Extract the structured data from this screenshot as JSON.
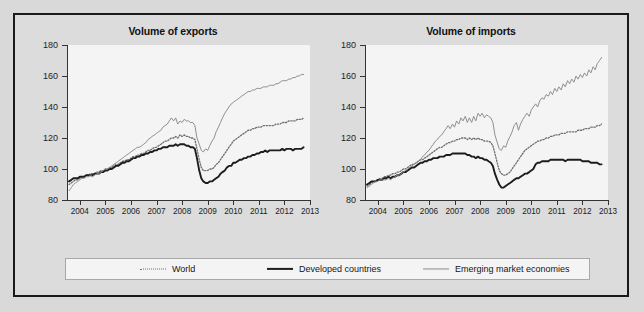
{
  "figure": {
    "background_color": "#dcdcdc",
    "border_color": "#1a1a1a",
    "plot_background_color": "#f4f4f4"
  },
  "legend": {
    "position": "bottom-center",
    "items": [
      {
        "label": "World",
        "style": "dotted",
        "color": "#6e6e6e"
      },
      {
        "label": "Developed countries",
        "style": "solid-thick",
        "color": "#1d1d1d"
      },
      {
        "label": "Emerging market economies",
        "style": "solid-thin",
        "color": "#8a8a8a"
      }
    ]
  },
  "chart_data": [
    {
      "type": "line",
      "title": "Volume of exports",
      "xlabel": "",
      "ylabel": "",
      "ylim": [
        80,
        180
      ],
      "yticks": [
        80,
        100,
        120,
        140,
        160,
        180
      ],
      "xlim": [
        2003.5,
        2013.0
      ],
      "xticks": [
        2004,
        2005,
        2006,
        2007,
        2008,
        2009,
        2010,
        2011,
        2012,
        2013
      ],
      "xtick_labels": [
        "2004",
        "2005",
        "2006",
        "2007",
        "2008",
        "2009",
        "2010",
        "2011",
        "2012",
        "2013"
      ],
      "grid": false,
      "x": [
        2003.58,
        2003.67,
        2003.75,
        2003.83,
        2003.92,
        2004.0,
        2004.08,
        2004.17,
        2004.25,
        2004.33,
        2004.42,
        2004.5,
        2004.58,
        2004.67,
        2004.75,
        2004.83,
        2004.92,
        2005.0,
        2005.08,
        2005.17,
        2005.25,
        2005.33,
        2005.42,
        2005.5,
        2005.58,
        2005.67,
        2005.75,
        2005.83,
        2005.92,
        2006.0,
        2006.08,
        2006.17,
        2006.25,
        2006.33,
        2006.42,
        2006.5,
        2006.58,
        2006.67,
        2006.75,
        2006.83,
        2006.92,
        2007.0,
        2007.08,
        2007.17,
        2007.25,
        2007.33,
        2007.42,
        2007.5,
        2007.58,
        2007.67,
        2007.75,
        2007.83,
        2007.92,
        2008.0,
        2008.08,
        2008.17,
        2008.25,
        2008.33,
        2008.42,
        2008.5,
        2008.58,
        2008.67,
        2008.75,
        2008.83,
        2008.92,
        2009.0,
        2009.08,
        2009.17,
        2009.25,
        2009.33,
        2009.42,
        2009.5,
        2009.58,
        2009.67,
        2009.75,
        2009.83,
        2009.92,
        2010.0,
        2010.08,
        2010.17,
        2010.25,
        2010.33,
        2010.42,
        2010.5,
        2010.58,
        2010.67,
        2010.75,
        2010.83,
        2010.92,
        2011.0,
        2011.08,
        2011.17,
        2011.25,
        2011.33,
        2011.42,
        2011.5,
        2011.58,
        2011.67,
        2011.75,
        2011.83,
        2011.92,
        2012.0,
        2012.08,
        2012.17,
        2012.25,
        2012.33,
        2012.42,
        2012.5,
        2012.58,
        2012.67,
        2012.75,
        2012.83,
        2012.92
      ],
      "series": [
        {
          "name": "World",
          "style": "dotted",
          "color": "#6e6e6e",
          "values": [
            90,
            91,
            92,
            93,
            93,
            94,
            95,
            95,
            96,
            96,
            97,
            97,
            97,
            98,
            98,
            99,
            99,
            100,
            100,
            101,
            101,
            102,
            103,
            103,
            104,
            105,
            105,
            106,
            106,
            107,
            108,
            108,
            109,
            109,
            110,
            110,
            111,
            112,
            112,
            113,
            114,
            114,
            115,
            116,
            117,
            118,
            118,
            119,
            120,
            120,
            121,
            120,
            122,
            121,
            122,
            121,
            121,
            120,
            120,
            119,
            113,
            106,
            101,
            99,
            99,
            99,
            100,
            100,
            101,
            103,
            104,
            106,
            108,
            110,
            112,
            114,
            116,
            118,
            119,
            120,
            121,
            122,
            123,
            124,
            125,
            125,
            126,
            126,
            127,
            127,
            127,
            128,
            128,
            128,
            128,
            128,
            128,
            129,
            129,
            129,
            130,
            130,
            130,
            131,
            131,
            131,
            131,
            132,
            132,
            132,
            133
          ]
        },
        {
          "name": "Developed countries",
          "style": "solid-thick",
          "color": "#1d1d1d",
          "values": [
            92,
            93,
            94,
            94,
            94,
            95,
            95,
            95,
            96,
            96,
            96,
            96,
            97,
            97,
            97,
            98,
            98,
            99,
            99,
            100,
            100,
            101,
            102,
            102,
            103,
            104,
            104,
            105,
            105,
            106,
            107,
            107,
            108,
            108,
            109,
            109,
            110,
            110,
            111,
            111,
            112,
            112,
            113,
            113,
            114,
            114,
            114,
            115,
            115,
            115,
            116,
            115,
            116,
            116,
            116,
            115,
            115,
            114,
            114,
            113,
            107,
            99,
            94,
            92,
            91,
            91,
            92,
            92,
            93,
            94,
            95,
            97,
            98,
            99,
            101,
            102,
            102,
            104,
            104,
            105,
            106,
            106,
            107,
            107,
            108,
            108,
            109,
            109,
            110,
            110,
            111,
            111,
            112,
            111,
            112,
            112,
            112,
            112,
            112,
            112,
            113,
            112,
            113,
            113,
            113,
            112,
            113,
            113,
            113,
            113,
            114
          ]
        },
        {
          "name": "Emerging market economies",
          "style": "solid-thin",
          "color": "#8a8a8a",
          "values": [
            86,
            88,
            90,
            91,
            92,
            93,
            94,
            94,
            95,
            95,
            96,
            95,
            96,
            97,
            97,
            98,
            99,
            100,
            100,
            101,
            102,
            103,
            104,
            105,
            106,
            107,
            108,
            109,
            110,
            111,
            112,
            113,
            114,
            114,
            115,
            116,
            117,
            119,
            120,
            121,
            122,
            123,
            124,
            125,
            127,
            128,
            129,
            131,
            133,
            131,
            133,
            129,
            131,
            130,
            132,
            131,
            131,
            130,
            130,
            128,
            120,
            116,
            112,
            111,
            113,
            112,
            115,
            118,
            120,
            124,
            127,
            130,
            133,
            136,
            138,
            140,
            142,
            143,
            144,
            145,
            146,
            147,
            148,
            149,
            150,
            150,
            151,
            151,
            152,
            152,
            152,
            153,
            153,
            153,
            154,
            154,
            154,
            155,
            155,
            156,
            157,
            157,
            157,
            158,
            158,
            159,
            159,
            160,
            160,
            161,
            161
          ]
        }
      ]
    },
    {
      "type": "line",
      "title": "Volume of imports",
      "xlabel": "",
      "ylabel": "",
      "ylim": [
        80,
        180
      ],
      "yticks": [
        80,
        100,
        120,
        140,
        160,
        180
      ],
      "xlim": [
        2003.5,
        2013.0
      ],
      "xticks": [
        2004,
        2005,
        2006,
        2007,
        2008,
        2009,
        2010,
        2011,
        2012,
        2013
      ],
      "xtick_labels": [
        "2004",
        "2005",
        "2006",
        "2007",
        "2008",
        "2009",
        "2010",
        "2011",
        "2012",
        "2013"
      ],
      "grid": false,
      "x": [
        2003.58,
        2003.67,
        2003.75,
        2003.83,
        2003.92,
        2004.0,
        2004.08,
        2004.17,
        2004.25,
        2004.33,
        2004.42,
        2004.5,
        2004.58,
        2004.67,
        2004.75,
        2004.83,
        2004.92,
        2005.0,
        2005.08,
        2005.17,
        2005.25,
        2005.33,
        2005.42,
        2005.5,
        2005.58,
        2005.67,
        2005.75,
        2005.83,
        2005.92,
        2006.0,
        2006.08,
        2006.17,
        2006.25,
        2006.33,
        2006.42,
        2006.5,
        2006.58,
        2006.67,
        2006.75,
        2006.83,
        2006.92,
        2007.0,
        2007.08,
        2007.17,
        2007.25,
        2007.33,
        2007.42,
        2007.5,
        2007.58,
        2007.67,
        2007.75,
        2007.83,
        2007.92,
        2008.0,
        2008.08,
        2008.17,
        2008.25,
        2008.33,
        2008.42,
        2008.5,
        2008.58,
        2008.67,
        2008.75,
        2008.83,
        2008.92,
        2009.0,
        2009.08,
        2009.17,
        2009.25,
        2009.33,
        2009.42,
        2009.5,
        2009.58,
        2009.67,
        2009.75,
        2009.83,
        2009.92,
        2010.0,
        2010.08,
        2010.17,
        2010.25,
        2010.33,
        2010.42,
        2010.5,
        2010.58,
        2010.67,
        2010.75,
        2010.83,
        2010.92,
        2011.0,
        2011.08,
        2011.17,
        2011.25,
        2011.33,
        2011.42,
        2011.5,
        2011.58,
        2011.67,
        2011.75,
        2011.83,
        2011.92,
        2012.0,
        2012.08,
        2012.17,
        2012.25,
        2012.33,
        2012.42,
        2012.5,
        2012.58,
        2012.67,
        2012.75,
        2012.83,
        2012.92
      ],
      "series": [
        {
          "name": "World",
          "style": "dotted",
          "color": "#6e6e6e",
          "values": [
            89,
            90,
            91,
            92,
            92,
            93,
            94,
            94,
            95,
            95,
            96,
            96,
            97,
            97,
            98,
            98,
            99,
            100,
            100,
            101,
            102,
            103,
            103,
            104,
            105,
            106,
            106,
            107,
            108,
            109,
            110,
            111,
            112,
            113,
            114,
            114,
            115,
            116,
            117,
            117,
            118,
            118,
            119,
            119,
            120,
            120,
            120,
            119,
            120,
            119,
            120,
            119,
            120,
            119,
            119,
            118,
            118,
            118,
            117,
            115,
            110,
            104,
            99,
            97,
            96,
            96,
            97,
            98,
            100,
            102,
            104,
            106,
            108,
            110,
            112,
            113,
            114,
            115,
            116,
            117,
            118,
            118,
            119,
            119,
            120,
            120,
            121,
            121,
            122,
            122,
            122,
            123,
            123,
            123,
            124,
            124,
            124,
            124,
            124,
            125,
            125,
            125,
            126,
            126,
            126,
            127,
            127,
            127,
            128,
            128,
            129
          ]
        },
        {
          "name": "Developed countries",
          "style": "solid-thick",
          "color": "#1d1d1d",
          "values": [
            90,
            91,
            92,
            92,
            92,
            93,
            93,
            93,
            94,
            94,
            95,
            94,
            95,
            95,
            96,
            96,
            97,
            98,
            98,
            99,
            100,
            101,
            101,
            102,
            103,
            104,
            104,
            105,
            105,
            106,
            106,
            107,
            107,
            107,
            108,
            108,
            108,
            109,
            109,
            109,
            110,
            110,
            110,
            110,
            110,
            110,
            110,
            109,
            109,
            108,
            108,
            107,
            108,
            107,
            107,
            106,
            106,
            105,
            104,
            102,
            97,
            93,
            90,
            88,
            88,
            89,
            90,
            91,
            92,
            93,
            94,
            94,
            95,
            96,
            97,
            97,
            98,
            99,
            100,
            103,
            104,
            104,
            105,
            105,
            105,
            105,
            106,
            106,
            106,
            106,
            106,
            106,
            106,
            105,
            106,
            106,
            106,
            106,
            106,
            106,
            106,
            105,
            105,
            105,
            105,
            104,
            104,
            104,
            104,
            103,
            103
          ]
        },
        {
          "name": "Emerging market economies",
          "style": "solid-thin",
          "color": "#8a8a8a",
          "values": [
            88,
            89,
            90,
            91,
            92,
            92,
            93,
            93,
            93,
            93,
            94,
            93,
            94,
            95,
            96,
            96,
            97,
            98,
            99,
            100,
            101,
            102,
            103,
            104,
            105,
            106,
            108,
            109,
            111,
            112,
            114,
            116,
            118,
            119,
            121,
            122,
            124,
            126,
            128,
            126,
            129,
            127,
            131,
            129,
            133,
            131,
            134,
            130,
            133,
            130,
            134,
            131,
            136,
            134,
            136,
            133,
            135,
            134,
            133,
            130,
            122,
            117,
            113,
            112,
            115,
            114,
            118,
            121,
            124,
            128,
            130,
            125,
            129,
            132,
            134,
            136,
            134,
            138,
            140,
            142,
            140,
            144,
            146,
            145,
            148,
            147,
            150,
            148,
            152,
            150,
            153,
            151,
            155,
            153,
            157,
            155,
            158,
            156,
            160,
            158,
            161,
            159,
            162,
            160,
            164,
            162,
            166,
            164,
            168,
            170,
            172
          ]
        }
      ]
    }
  ]
}
